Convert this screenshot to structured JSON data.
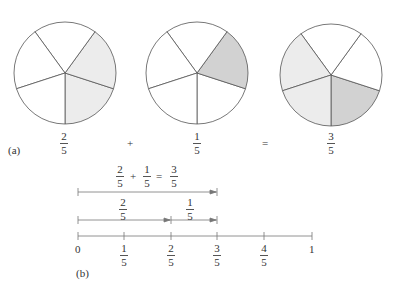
{
  "part_a": {
    "label": "(a)",
    "pies": [
      {
        "name": "two-fifths",
        "cx": 65,
        "cy": 73,
        "r": 51,
        "fills": [
          "light",
          "light",
          "none",
          "none",
          "none"
        ],
        "fraction": {
          "num": "2",
          "den": "5"
        }
      },
      {
        "name": "one-fifth",
        "cx": 197,
        "cy": 73,
        "r": 51,
        "fills": [
          "none",
          "dark",
          "none",
          "none",
          "none"
        ],
        "fraction": {
          "num": "1",
          "den": "5"
        }
      },
      {
        "name": "three-fifths",
        "cx": 331,
        "cy": 75,
        "r": 51,
        "fills": [
          "dark",
          "none",
          "none",
          "light",
          "light"
        ],
        "fraction": {
          "num": "3",
          "den": "5"
        }
      }
    ],
    "plus": "+",
    "equals": "="
  },
  "part_b": {
    "label": "(b)",
    "sum_equation": {
      "a_num": "2",
      "a_den": "5",
      "plus": "+",
      "b_num": "1",
      "b_den": "5",
      "eq": "=",
      "c_num": "3",
      "c_den": "5"
    },
    "seg1": {
      "num": "2",
      "den": "5"
    },
    "seg2": {
      "num": "1",
      "den": "5"
    },
    "ticks": [
      {
        "type": "int",
        "text": "0"
      },
      {
        "type": "frac",
        "num": "1",
        "den": "5"
      },
      {
        "type": "frac",
        "num": "2",
        "den": "5"
      },
      {
        "type": "frac",
        "num": "3",
        "den": "5"
      },
      {
        "type": "frac",
        "num": "4",
        "den": "5"
      },
      {
        "type": "int",
        "text": "1"
      }
    ]
  },
  "colors": {
    "light": "#ececec",
    "dark": "#d2d2d2",
    "stroke": "#555555"
  }
}
